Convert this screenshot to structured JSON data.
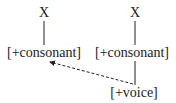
{
  "nodes": {
    "x_left": "X",
    "x_right": "X",
    "cons_left": "[+consonant]",
    "cons_right": "[+consonant]",
    "voice": "[+voice]"
  },
  "edges": [
    {
      "from": "x_left",
      "to": "cons_left",
      "style": "solid"
    },
    {
      "from": "x_right",
      "to": "cons_right",
      "style": "solid"
    },
    {
      "from": "cons_right",
      "to": "voice",
      "style": "solid"
    },
    {
      "from": "voice",
      "to": "cons_left",
      "style": "dashed-arrow"
    }
  ]
}
